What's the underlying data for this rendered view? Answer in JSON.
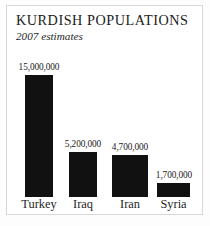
{
  "chart_data": {
    "type": "bar",
    "title": "KURDISH POPULATIONS",
    "subtitle": "2007 estimates",
    "xlabel": "",
    "ylabel": "",
    "grid": false,
    "legend": "none",
    "ylim": [
      0,
      15000000
    ],
    "categories": [
      "Turkey",
      "Iraq",
      "Iran",
      "Syria"
    ],
    "values": [
      15000000,
      5200000,
      4700000,
      1700000
    ],
    "value_labels": [
      "15,000,000",
      "5,200,000",
      "4,700,000",
      "1,700,000"
    ],
    "bar_color": "#111111",
    "background_color": "#ffffff",
    "frame_color": "#d8d7d3"
  },
  "bars": [
    {
      "category": "Turkey",
      "value_label": "15,000,000",
      "left": 25,
      "width": 28,
      "height": 122,
      "label_left": 10,
      "label_top": 63,
      "label_width": 58,
      "cat_left": 11,
      "cat_width": 56
    },
    {
      "category": "Iraq",
      "value_label": "5,200,000",
      "left": 69,
      "width": 28,
      "height": 45,
      "label_left": 57,
      "label_top": 140,
      "label_width": 52,
      "cat_left": 59,
      "cat_width": 48
    },
    {
      "category": "Iran",
      "value_label": "4,700,000",
      "left": 112,
      "width": 36,
      "height": 42,
      "label_left": 104,
      "label_top": 143,
      "label_width": 52,
      "cat_left": 106,
      "cat_width": 48
    },
    {
      "category": "Syria",
      "value_label": "1,700,000",
      "left": 157,
      "width": 33,
      "height": 14,
      "label_left": 148,
      "label_top": 171,
      "label_width": 52,
      "cat_left": 149,
      "cat_width": 49
    }
  ]
}
